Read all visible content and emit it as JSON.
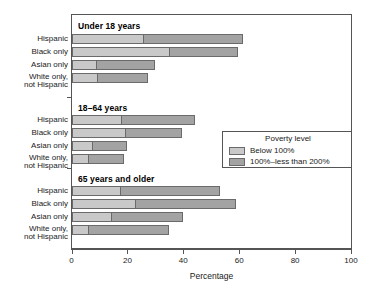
{
  "chart_data": {
    "type": "bar",
    "orientation": "horizontal",
    "stacked": true,
    "title": "",
    "xlabel": "Percentage",
    "ylabel": "",
    "xlim": [
      0,
      100
    ],
    "xticks": [
      0,
      20,
      40,
      60,
      80,
      100
    ],
    "xtick_labels": [
      "0",
      "20",
      "40",
      "60",
      "80",
      "100"
    ],
    "grid": false,
    "legend": {
      "title": "Poverty level",
      "position": "middle-right",
      "entries": [
        {
          "label": "Below 100%",
          "color": "#c9c9c9"
        },
        {
          "label": "100%–less than 200%",
          "color": "#a3a3a3"
        }
      ]
    },
    "series": [
      {
        "name": "Below 100%",
        "color": "#c9c9c9"
      },
      {
        "name": "100%–less than 200%",
        "color": "#a3a3a3"
      }
    ],
    "groups": [
      {
        "name": "Under 18 years",
        "categories": [
          "Hispanic",
          "Black only",
          "Asian only",
          "White only, not Hispanic"
        ],
        "below_100": [
          25.9,
          35.1,
          9.2,
          9.5
        ],
        "between_100_200": [
          35.6,
          24.6,
          20.7,
          17.9
        ],
        "totals": [
          61.5,
          59.7,
          29.9,
          27.4
        ]
      },
      {
        "name": "18–64 years",
        "categories": [
          "Hispanic",
          "Black only",
          "Asian only",
          "White only, not Hispanic"
        ],
        "below_100": [
          18.2,
          19.6,
          7.7,
          6.2
        ],
        "between_100_200": [
          26.0,
          19.8,
          12.3,
          12.6
        ],
        "totals": [
          44.2,
          39.4,
          20.0,
          18.8
        ]
      },
      {
        "name": "65 years and older",
        "categories": [
          "Hispanic",
          "Black only",
          "Asian only",
          "White only, not Hispanic"
        ],
        "below_100": [
          17.8,
          23.2,
          14.5,
          6.2
        ],
        "between_100_200": [
          35.3,
          35.8,
          25.5,
          28.8
        ],
        "totals": [
          53.1,
          59.0,
          40.0,
          35.0
        ]
      }
    ]
  }
}
